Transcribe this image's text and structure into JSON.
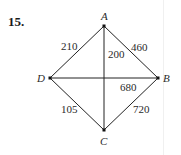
{
  "problem": {
    "number": "15."
  },
  "graph": {
    "nodes": [
      {
        "id": "A",
        "label": "A",
        "x": 104,
        "y": 26
      },
      {
        "id": "B",
        "label": "B",
        "x": 158,
        "y": 78
      },
      {
        "id": "C",
        "label": "C",
        "x": 104,
        "y": 130
      },
      {
        "id": "D",
        "label": "D",
        "x": 50,
        "y": 78
      }
    ],
    "edges": [
      {
        "from": "A",
        "to": "D",
        "weight": "210"
      },
      {
        "from": "A",
        "to": "B",
        "weight": "460"
      },
      {
        "from": "A",
        "to": "C",
        "weight": "200"
      },
      {
        "from": "D",
        "to": "B",
        "weight": "680"
      },
      {
        "from": "D",
        "to": "C",
        "weight": "105"
      },
      {
        "from": "B",
        "to": "C",
        "weight": "720"
      }
    ]
  },
  "colors": {
    "line": "#222222",
    "text": "#2a2a2a"
  }
}
